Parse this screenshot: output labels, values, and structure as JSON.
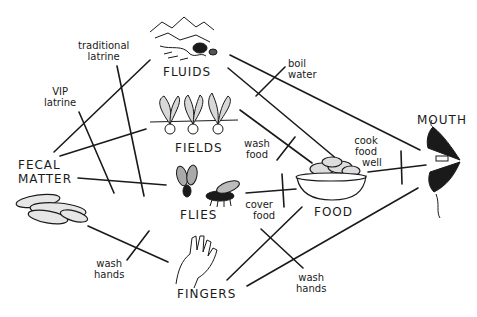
{
  "diagram": {
    "nodes": {
      "fecal_matter": {
        "line1": "FECAL",
        "line2": "MATTER"
      },
      "fluids": {
        "label": "FLUIDS"
      },
      "fields": {
        "label": "FIELDS"
      },
      "flies": {
        "label": "FLIES"
      },
      "fingers": {
        "label": "FINGERS"
      },
      "food": {
        "label": "FOOD"
      },
      "mouth": {
        "label": "MOUTH"
      }
    },
    "barriers": {
      "traditional_latrine": {
        "line1": "traditional",
        "line2": "latrine"
      },
      "vip_latrine": {
        "line1": "VIP",
        "line2": "latrine"
      },
      "boil_water": {
        "line1": "boil",
        "line2": "water"
      },
      "wash_food": {
        "line1": "wash",
        "line2": "food"
      },
      "cook_food_well": {
        "line1": "cook",
        "line2": "food",
        "line3": "well"
      },
      "cover_food": {
        "line1": "cover",
        "line2": "food"
      },
      "wash_hands_left": {
        "line1": "wash",
        "line2": "hands"
      },
      "wash_hands_right": {
        "line1": "wash",
        "line2": "hands"
      }
    },
    "colors": {
      "ink": "#1a1a1a",
      "background": "#ffffff"
    }
  }
}
